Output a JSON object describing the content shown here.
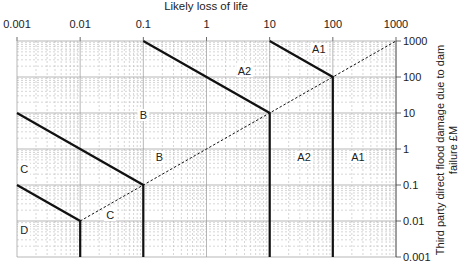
{
  "chart_data": {
    "type": "line",
    "title": "",
    "xlabel": "Likely loss of life",
    "ylabel": "Third party direct flood damage due to dam failure £M",
    "xscale": "log",
    "yscale": "log",
    "xlim": [
      0.001,
      1000
    ],
    "ylim": [
      0.001,
      1000
    ],
    "x_axis_position": "top",
    "y_axis_position": "right",
    "grid": true,
    "x_ticks": [
      "0.001",
      "0.01",
      "0.1",
      "1",
      "10",
      "100",
      "1000"
    ],
    "y_ticks": [
      "1000",
      "100",
      "10",
      "1",
      "0.1",
      "0.01",
      "0.001"
    ],
    "boundaries": [
      {
        "name": "A1 boundary",
        "style": "solid",
        "points": [
          [
            10,
            1000
          ],
          [
            100,
            100
          ],
          [
            100,
            0.001
          ]
        ]
      },
      {
        "name": "A2 boundary",
        "style": "solid",
        "points": [
          [
            0.1,
            1000
          ],
          [
            10,
            10
          ],
          [
            10,
            0.001
          ]
        ]
      },
      {
        "name": "B boundary",
        "style": "solid",
        "points": [
          [
            0.001,
            10
          ],
          [
            0.1,
            0.1
          ],
          [
            0.1,
            0.001
          ]
        ]
      },
      {
        "name": "C boundary",
        "style": "solid",
        "points": [
          [
            0.001,
            0.1
          ],
          [
            0.01,
            0.01
          ],
          [
            0.01,
            0.001
          ]
        ]
      },
      {
        "name": "diagonal",
        "style": "dashed",
        "points": [
          [
            0.01,
            0.01
          ],
          [
            1000,
            1000
          ]
        ]
      }
    ],
    "region_labels": [
      {
        "text": "A1",
        "x": 60,
        "y": 600
      },
      {
        "text": "A1",
        "x": 250,
        "y": 0.6
      },
      {
        "text": "A2",
        "x": 4,
        "y": 150
      },
      {
        "text": "A2",
        "x": 35,
        "y": 0.6
      },
      {
        "text": "B",
        "x": 0.1,
        "y": 9
      },
      {
        "text": "B",
        "x": 0.18,
        "y": 0.6
      },
      {
        "text": "C",
        "x": 0.0013,
        "y": 0.28
      },
      {
        "text": "C",
        "x": 0.03,
        "y": 0.0145
      },
      {
        "text": "D",
        "x": 0.0013,
        "y": 0.0055
      }
    ]
  }
}
